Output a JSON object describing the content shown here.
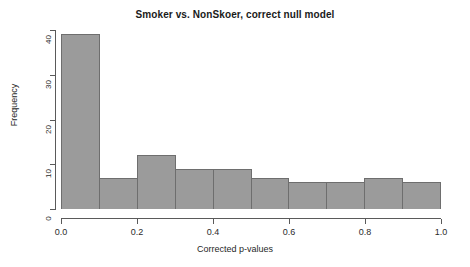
{
  "chart_data": {
    "type": "bar",
    "title": "Smoker vs. NonSkoer, correct null model",
    "subtitle": "",
    "xlabel": "Corrected p-values",
    "ylabel": "Frequency",
    "categories": [
      "0.0-0.1",
      "0.1-0.2",
      "0.2-0.3",
      "0.3-0.4",
      "0.4-0.5",
      "0.5-0.6",
      "0.6-0.7",
      "0.7-0.8",
      "0.8-0.9",
      "0.9-1.0"
    ],
    "bin_edges": [
      0.0,
      0.1,
      0.2,
      0.3,
      0.4,
      0.5,
      0.6,
      0.7,
      0.8,
      0.9,
      1.0
    ],
    "values": [
      39,
      7,
      12,
      9,
      9,
      7,
      6,
      6,
      7,
      6
    ],
    "xlim": [
      0.0,
      1.0
    ],
    "ylim": [
      0,
      40
    ],
    "x_ticks": [
      "0.0",
      "0.2",
      "0.4",
      "0.6",
      "0.8",
      "1.0"
    ],
    "x_tick_values": [
      0.0,
      0.2,
      0.4,
      0.6,
      0.8,
      1.0
    ],
    "y_ticks": [
      "0",
      "10",
      "20",
      "30",
      "40"
    ],
    "y_tick_values": [
      0,
      10,
      20,
      30,
      40
    ],
    "grid": false,
    "legend": false,
    "bar_fill_color": "#9b9b9b",
    "bar_border_color": "#6e6e6e",
    "axis_color": "#5a5a5a",
    "background_color": "#ffffff"
  }
}
